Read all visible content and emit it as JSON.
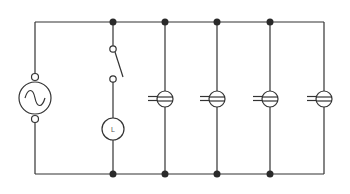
{
  "diagram": {
    "type": "electrical-circuit-schematic",
    "colors": {
      "wire": "#333333",
      "node": "#2a2a2a",
      "background": "#ffffff"
    },
    "rails": {
      "top_y": 22,
      "bottom_y": 174,
      "left_x": 35,
      "right_x": 324
    },
    "source": {
      "name": "ac-voltage-source",
      "symbol": "~",
      "cx": 35,
      "cy": 98,
      "r": 16
    },
    "switch_branch": {
      "x": 113,
      "switch_label": "",
      "lamp_label": "L"
    },
    "sockets": [
      {
        "x": 165,
        "cy": 99
      },
      {
        "x": 217,
        "cy": 99
      },
      {
        "x": 270,
        "cy": 99
      },
      {
        "x": 324,
        "cy": 99
      }
    ],
    "junction_nodes_top": [
      113,
      165,
      217,
      270
    ],
    "junction_nodes_bottom": [
      113,
      165,
      217,
      270
    ]
  }
}
